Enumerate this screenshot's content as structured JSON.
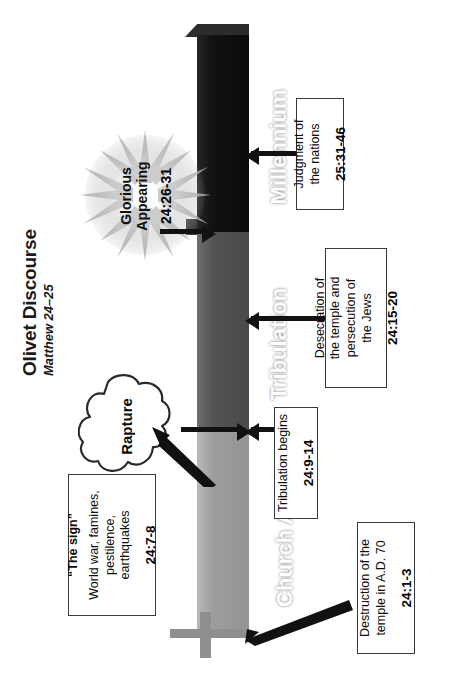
{
  "title": {
    "main": "Olivet Discourse",
    "subtitle": "Matthew 24–25"
  },
  "timeline": {
    "segments": [
      {
        "id": "church-age",
        "label": "Church Age",
        "color": "#9d9d9d"
      },
      {
        "id": "tribulation",
        "label": "Tribulation",
        "color": "#545454"
      },
      {
        "id": "millennium",
        "label": "Millennium",
        "color": "#121212"
      }
    ]
  },
  "events": {
    "rapture": {
      "label": "Rapture"
    },
    "glorious_appearing": {
      "line1": "Glorious",
      "line2": "Appearing",
      "reference": "24:26-31"
    }
  },
  "callouts": [
    {
      "id": "destruction-of-temple",
      "lines": [
        "Destruction of the",
        "temple in A.D. 70"
      ],
      "reference": "24:1-3"
    },
    {
      "id": "the-sign",
      "heading": "“The sign”",
      "lines": [
        "World war, famines,",
        "pestilence,",
        "earthquakes"
      ],
      "reference": "24:7-8"
    },
    {
      "id": "tribulation-begins",
      "lines": [
        "Tribulation begins"
      ],
      "reference": "24:9-14"
    },
    {
      "id": "desecration-of-temple",
      "lines": [
        "Desecration of",
        "the temple and",
        "persecution of",
        "the Jews"
      ],
      "reference": "24:15-20"
    },
    {
      "id": "judgment-of-nations",
      "lines": [
        "Judgment of",
        "the nations"
      ],
      "reference": "25:31-46"
    }
  ]
}
